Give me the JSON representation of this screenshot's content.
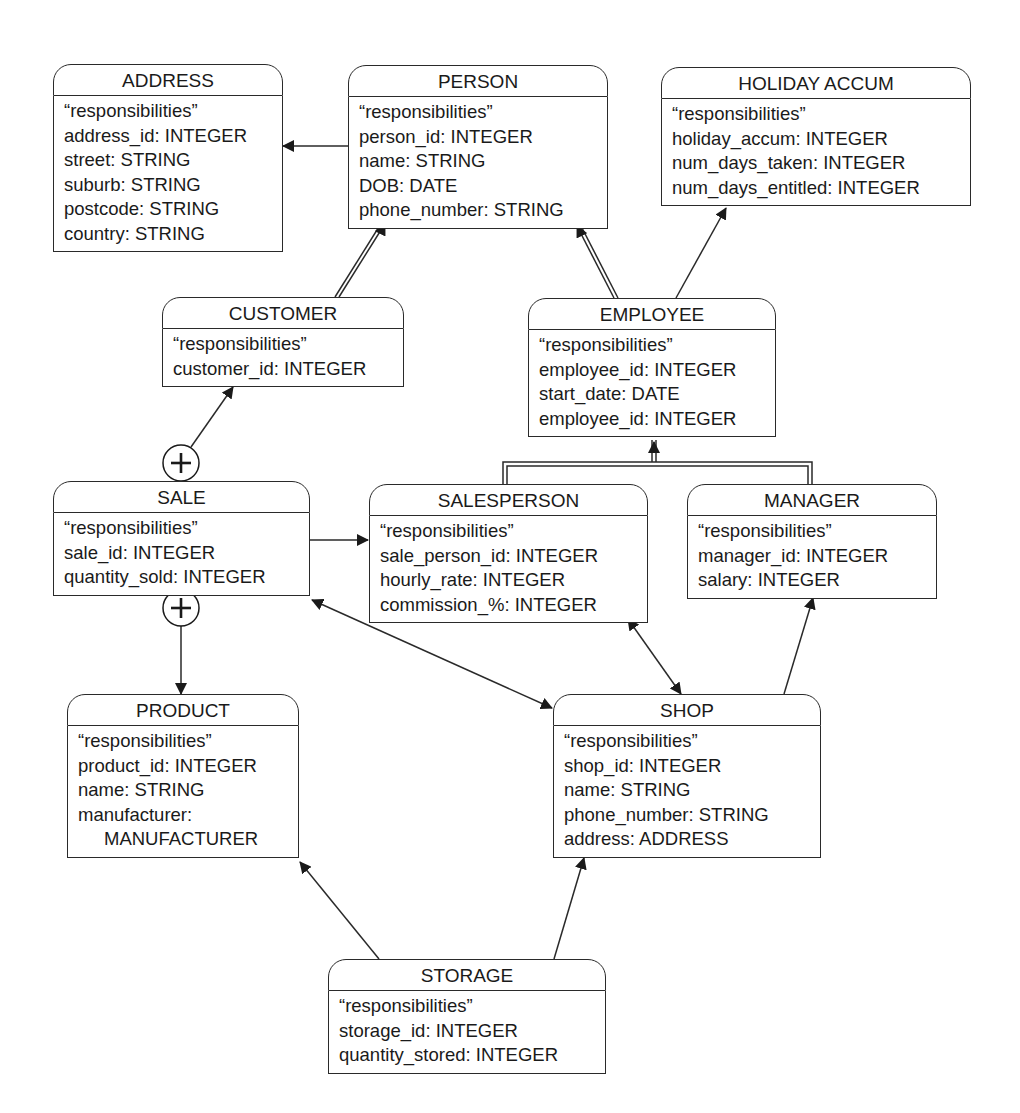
{
  "diagram": {
    "type": "class-diagram",
    "classes": {
      "address": {
        "title": "ADDRESS",
        "attrs": [
          "“responsibilities”",
          "address_id: INTEGER",
          "street: STRING",
          "suburb: STRING",
          "postcode: STRING",
          "country: STRING"
        ]
      },
      "person": {
        "title": "PERSON",
        "attrs": [
          "“responsibilities”",
          "person_id: INTEGER",
          "name: STRING",
          "DOB: DATE",
          "phone_number: STRING"
        ]
      },
      "holiday": {
        "title": "HOLIDAY ACCUM",
        "attrs": [
          "“responsibilities”",
          "holiday_accum: INTEGER",
          "num_days_taken: INTEGER",
          "num_days_entitled: INTEGER"
        ]
      },
      "customer": {
        "title": "CUSTOMER",
        "attrs": [
          "“responsibilities”",
          "customer_id: INTEGER"
        ]
      },
      "employee": {
        "title": "EMPLOYEE",
        "attrs": [
          "“responsibilities”",
          "employee_id: INTEGER",
          "start_date: DATE",
          "employee_id: INTEGER"
        ]
      },
      "sale": {
        "title": "SALE",
        "attrs": [
          "“responsibilities”",
          "sale_id: INTEGER",
          "quantity_sold: INTEGER"
        ]
      },
      "salesperson": {
        "title": "SALESPERSON",
        "attrs": [
          "“responsibilities”",
          "sale_person_id: INTEGER",
          "hourly_rate: INTEGER",
          "commission_%: INTEGER"
        ]
      },
      "manager": {
        "title": "MANAGER",
        "attrs": [
          "“responsibilities”",
          "manager_id: INTEGER",
          "salary: INTEGER"
        ]
      },
      "product": {
        "title": "PRODUCT",
        "attrs": [
          "“responsibilities”",
          "product_id: INTEGER",
          "name: STRING",
          "manufacturer:",
          "MANUFACTURER"
        ]
      },
      "shop": {
        "title": "SHOP",
        "attrs": [
          "“responsibilities”",
          "shop_id: INTEGER",
          "name: STRING",
          "phone_number: STRING",
          "address: ADDRESS"
        ]
      },
      "storage": {
        "title": "STORAGE",
        "attrs": [
          "“responsibilities”",
          "storage_id: INTEGER",
          "quantity_stored: INTEGER"
        ]
      }
    },
    "relationships": [
      {
        "from": "PERSON",
        "to": "ADDRESS",
        "kind": "association"
      },
      {
        "from": "CUSTOMER",
        "to": "PERSON",
        "kind": "inheritance"
      },
      {
        "from": "EMPLOYEE",
        "to": "PERSON",
        "kind": "inheritance"
      },
      {
        "from": "EMPLOYEE",
        "to": "HOLIDAY ACCUM",
        "kind": "association"
      },
      {
        "from": "SALESPERSON",
        "to": "EMPLOYEE",
        "kind": "inheritance"
      },
      {
        "from": "MANAGER",
        "to": "EMPLOYEE",
        "kind": "inheritance"
      },
      {
        "from": "SALE",
        "to": "CUSTOMER",
        "kind": "aggregation"
      },
      {
        "from": "SALE",
        "to": "PRODUCT",
        "kind": "aggregation"
      },
      {
        "from": "SALE",
        "to": "SALESPERSON",
        "kind": "association"
      },
      {
        "from": "SALE",
        "to": "SHOP",
        "kind": "bidirectional"
      },
      {
        "from": "SALESPERSON",
        "to": "SHOP",
        "kind": "bidirectional"
      },
      {
        "from": "SHOP",
        "to": "MANAGER",
        "kind": "association"
      },
      {
        "from": "STORAGE",
        "to": "PRODUCT",
        "kind": "association"
      },
      {
        "from": "STORAGE",
        "to": "SHOP",
        "kind": "association"
      }
    ],
    "aggregation_symbol": "+",
    "line_color": "#2a2a2a"
  }
}
